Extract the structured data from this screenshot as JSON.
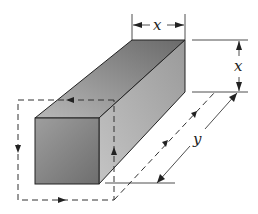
{
  "figure": {
    "labels": {
      "top_width": "x",
      "right_height": "x",
      "length": "y"
    },
    "colors": {
      "line": "#222222",
      "front_face": "#8a8a8a",
      "top_face": "#9a9a9a",
      "side_face": "#b5b5b5"
    }
  }
}
